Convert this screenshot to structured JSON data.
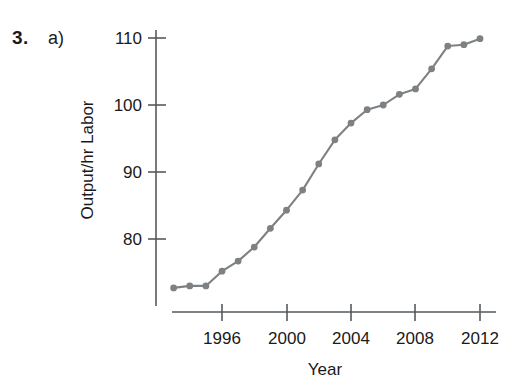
{
  "exercise": {
    "number": "3.",
    "part": "a)"
  },
  "chart_data": {
    "type": "line",
    "title": "",
    "xlabel": "Year",
    "ylabel": "Output/hr Labor",
    "xlim": [
      1992.5,
      2012.6
    ],
    "ylim": [
      70.5,
      111.5
    ],
    "grid": false,
    "legend": "none",
    "xticks": [
      1996,
      2000,
      2004,
      2008,
      2012
    ],
    "xtick_labels": [
      "1996",
      "2000",
      "2004",
      "2008",
      "2012"
    ],
    "yticks": [
      80,
      90,
      100,
      110
    ],
    "ytick_labels": [
      "80",
      "90",
      "100",
      "110"
    ],
    "marker": "circle",
    "line_color": "#7e8183",
    "marker_color": "#7e8183",
    "axis_color": "#555a5e",
    "x": [
      1993,
      1994,
      1995,
      1996,
      1997,
      1998,
      1999,
      2000,
      2001,
      2002,
      2003,
      2004,
      2005,
      2006,
      2007,
      2008,
      2009,
      2010,
      2011,
      2012
    ],
    "values": [
      72.7,
      73.0,
      73.0,
      75.2,
      76.7,
      78.8,
      81.6,
      84.3,
      87.3,
      91.2,
      94.8,
      97.3,
      99.3,
      100.0,
      101.6,
      102.4,
      105.4,
      108.8,
      109.0,
      109.9
    ],
    "series": [
      {
        "name": "Output per hour of labor",
        "values": [
          72.7,
          73.0,
          73.0,
          75.2,
          76.7,
          78.8,
          81.6,
          84.3,
          87.3,
          91.2,
          94.8,
          97.3,
          99.3,
          100.0,
          101.6,
          102.4,
          105.4,
          108.8,
          109.0,
          109.9
        ]
      }
    ]
  }
}
